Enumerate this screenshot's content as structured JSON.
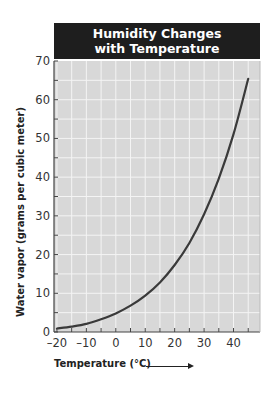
{
  "chart_data": {
    "type": "line",
    "title": "Humidity Changes with Temperature",
    "title_lines": [
      "Humidity Changes",
      "with Temperature"
    ],
    "xlabel": "Temperature (°C)",
    "ylabel": "Water vapor (grams per cubic meter)",
    "x_ticks": [
      -20,
      -10,
      0,
      10,
      20,
      30,
      40
    ],
    "y_ticks": [
      0,
      10,
      20,
      30,
      40,
      50,
      60,
      70
    ],
    "xlim": [
      -21,
      49
    ],
    "ylim": [
      0,
      70
    ],
    "grid": true,
    "grid_step_x": 5,
    "grid_step_y": 5,
    "legend": null,
    "series": [
      {
        "name": "Water vapor capacity",
        "x": [
          -20,
          -15,
          -10,
          -5,
          0,
          5,
          10,
          15,
          20,
          25,
          30,
          35,
          40,
          45
        ],
        "values": [
          0.9,
          1.4,
          2.1,
          3.3,
          4.8,
          6.8,
          9.4,
          12.8,
          17.3,
          23.0,
          30.4,
          39.6,
          51.1,
          65.4
        ]
      }
    ]
  },
  "colors": {
    "title_bg": "#1e1e1e",
    "title_text": "#ffffff",
    "plot_bg": "#d8d8d8",
    "grid": "#f4f4f4",
    "line": "#3a3a3a",
    "axis": "#444444"
  }
}
